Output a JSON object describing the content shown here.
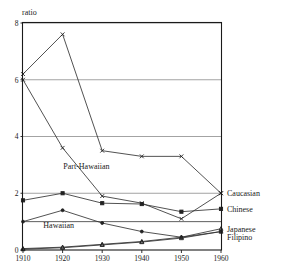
{
  "chart_data": {
    "type": "line",
    "title": "",
    "subtitle": "",
    "xlabel": "",
    "ylabel": "ratio",
    "x": [
      1910,
      1920,
      1930,
      1940,
      1950,
      1960
    ],
    "xticklabels": [
      "1910",
      "1920",
      "1930",
      "1940",
      "1950",
      "1960"
    ],
    "yticklabels": [
      "0",
      "2",
      "4",
      "6",
      "8"
    ],
    "yticks": [
      0,
      2,
      4,
      6,
      8
    ],
    "xlim": [
      1910,
      1960
    ],
    "ylim": [
      0,
      8
    ],
    "grid": "horizontal",
    "gridlines": [
      2,
      4,
      6,
      8
    ],
    "reference_lines": [
      1
    ],
    "legend_position": "right-edge-inline",
    "series": [
      {
        "name": "Part-Hawaiian",
        "label_position": "inside",
        "values": [
          6.2,
          7.6,
          3.5,
          3.3,
          3.3,
          2.0
        ],
        "marker": "x"
      },
      {
        "name": "Caucasian",
        "label_position": "right",
        "values": [
          6.0,
          3.6,
          1.9,
          1.65,
          1.1,
          2.0
        ],
        "marker": "x"
      },
      {
        "name": "Chinese",
        "label_position": "right",
        "values": [
          1.75,
          2.0,
          1.65,
          1.62,
          1.35,
          1.45
        ],
        "marker": "square"
      },
      {
        "name": "Hawaiian",
        "label_position": "inside",
        "values": [
          1.0,
          1.4,
          0.95,
          0.65,
          0.45,
          0.65
        ],
        "marker": "dot"
      },
      {
        "name": "Japanese",
        "label_position": "right",
        "values": [
          0.05,
          0.1,
          0.2,
          0.3,
          0.45,
          0.75
        ],
        "marker": "triangle"
      },
      {
        "name": "Filipino",
        "label_position": "right",
        "values": [
          0.03,
          0.08,
          0.18,
          0.28,
          0.42,
          0.65
        ],
        "marker": "triangle"
      }
    ],
    "annotations": [
      {
        "text": "Part-Hawaiian",
        "x": 1926,
        "y": 2.85
      },
      {
        "text": "Hawaiian",
        "x": 1919,
        "y": 0.78
      }
    ],
    "right_labels": [
      {
        "text": "Caucasian",
        "y": 2.0
      },
      {
        "text": "Chinese",
        "y": 1.45
      },
      {
        "text": "Japanese",
        "y": 0.75
      },
      {
        "text": "Filipino",
        "y": 0.45
      }
    ]
  }
}
